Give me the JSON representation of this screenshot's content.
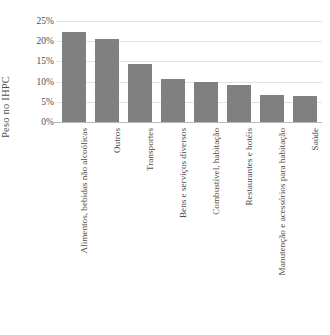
{
  "chart_data": {
    "type": "bar",
    "title": "",
    "xlabel": "",
    "ylabel": "Peso no IHPC",
    "ylim": [
      0,
      25
    ],
    "ytick_labels": [
      "0%",
      "5%",
      "10%",
      "15%",
      "20%",
      "25%"
    ],
    "ytick_values": [
      0,
      5,
      10,
      15,
      20,
      25
    ],
    "grid": true,
    "legend": false,
    "bar_color": "#808080",
    "gridline_color": "#e3e3e3",
    "axis_color": "#b9b9b9",
    "categories": [
      "Alimentos, bebidas não alcoólicas",
      "Outros",
      "Transportes",
      "Bens e serviços diversos",
      "Combustível, habitação",
      "Restaurantes e hotéis",
      "Manutenção e acessórios para habitação",
      "Saúde"
    ],
    "values": [
      22.2,
      20.5,
      14.4,
      10.6,
      9.9,
      9.2,
      6.7,
      6.5
    ],
    "units": "percent"
  }
}
